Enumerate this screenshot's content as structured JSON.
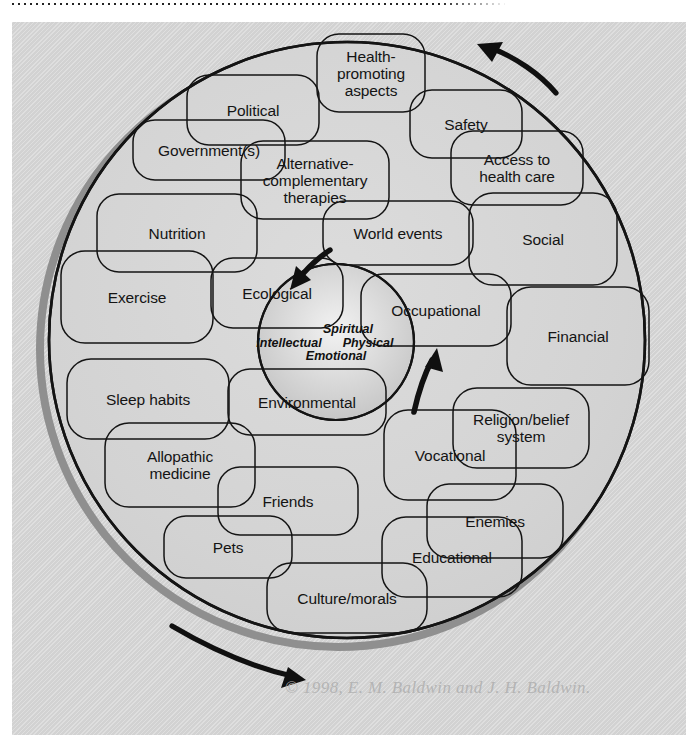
{
  "figure": {
    "copyright": "© 1998, E. M. Baldwin and J. H. Baldwin.",
    "colors": {
      "panel_background": "#d2d2d2",
      "line": "#141414",
      "shadow": "#8f8f8f",
      "copyright_text": "#b4b4b4",
      "core_glow": "#c8c8c8"
    }
  },
  "core": {
    "labels": [
      {
        "text": "Spiritual",
        "x": 348,
        "y": 329
      },
      {
        "text": "Intellectual",
        "x": 289,
        "y": 343
      },
      {
        "text": "Physical",
        "x": 368,
        "y": 343
      },
      {
        "text": "Emotional",
        "x": 336,
        "y": 356
      }
    ]
  },
  "nodes": [
    {
      "id": "health-promoting-aspects",
      "text": "Health-\npromoting\naspects",
      "x": 371,
      "y": 73,
      "w": 108,
      "h": 78
    },
    {
      "id": "political",
      "text": "Political",
      "x": 253,
      "y": 110,
      "w": 132,
      "h": 70
    },
    {
      "id": "safety",
      "text": "Safety",
      "x": 466,
      "y": 124,
      "w": 112,
      "h": 68
    },
    {
      "id": "governments",
      "text": "Government(s)",
      "x": 209,
      "y": 150,
      "w": 152,
      "h": 60
    },
    {
      "id": "access-to-health-care",
      "text": "Access to\nhealth care",
      "x": 517,
      "y": 168,
      "w": 132,
      "h": 74
    },
    {
      "id": "alternative-complementary",
      "text": "Alternative-\ncomplementary\ntherapies",
      "x": 315,
      "y": 180,
      "w": 148,
      "h": 78
    },
    {
      "id": "nutrition",
      "text": "Nutrition",
      "x": 177,
      "y": 233,
      "w": 160,
      "h": 78
    },
    {
      "id": "world-events",
      "text": "World events",
      "x": 398,
      "y": 233,
      "w": 150,
      "h": 64
    },
    {
      "id": "social",
      "text": "Social",
      "x": 543,
      "y": 239,
      "w": 148,
      "h": 92
    },
    {
      "id": "exercise",
      "text": "Exercise",
      "x": 137,
      "y": 297,
      "w": 152,
      "h": 92
    },
    {
      "id": "ecological",
      "text": "Ecological",
      "x": 277,
      "y": 293,
      "w": 132,
      "h": 70
    },
    {
      "id": "occupational",
      "text": "Occupational",
      "x": 436,
      "y": 310,
      "w": 150,
      "h": 72
    },
    {
      "id": "financial",
      "text": "Financial",
      "x": 578,
      "y": 336,
      "w": 142,
      "h": 98
    },
    {
      "id": "sleep-habits",
      "text": "Sleep habits",
      "x": 148,
      "y": 399,
      "w": 162,
      "h": 80
    },
    {
      "id": "environmental",
      "text": "Environmental",
      "x": 307,
      "y": 402,
      "w": 158,
      "h": 66
    },
    {
      "id": "religion-belief-system",
      "text": "Religion/belief\nsystem",
      "x": 521,
      "y": 428,
      "w": 136,
      "h": 80
    },
    {
      "id": "vocational",
      "text": "Vocational",
      "x": 450,
      "y": 455,
      "w": 132,
      "h": 90
    },
    {
      "id": "allopathic-medicine",
      "text": "Allopathic\nmedicine",
      "x": 180,
      "y": 465,
      "w": 150,
      "h": 84
    },
    {
      "id": "friends",
      "text": "Friends",
      "x": 288,
      "y": 501,
      "w": 140,
      "h": 68
    },
    {
      "id": "enemies",
      "text": "Enemies",
      "x": 495,
      "y": 521,
      "w": 136,
      "h": 74
    },
    {
      "id": "pets",
      "text": "Pets",
      "x": 228,
      "y": 547,
      "w": 128,
      "h": 62
    },
    {
      "id": "educational",
      "text": "Educational",
      "x": 452,
      "y": 557,
      "w": 140,
      "h": 80
    },
    {
      "id": "culture-morals",
      "text": "Culture/morals",
      "x": 347,
      "y": 598,
      "w": 160,
      "h": 70
    }
  ],
  "arrows": [
    {
      "id": "arrow-top-counterclockwise",
      "direction": "up-left",
      "description": "curved arrow along top arc pointing left"
    },
    {
      "id": "arrow-inward",
      "direction": "down-left",
      "description": "short arrow pointing into the core from upper-left"
    },
    {
      "id": "arrow-outward",
      "direction": "up-right",
      "description": "short arrow pointing out of the core to upper-right"
    },
    {
      "id": "arrow-bottom-clockwise",
      "direction": "down-right",
      "description": "curved arrow along bottom arc pointing right"
    }
  ]
}
